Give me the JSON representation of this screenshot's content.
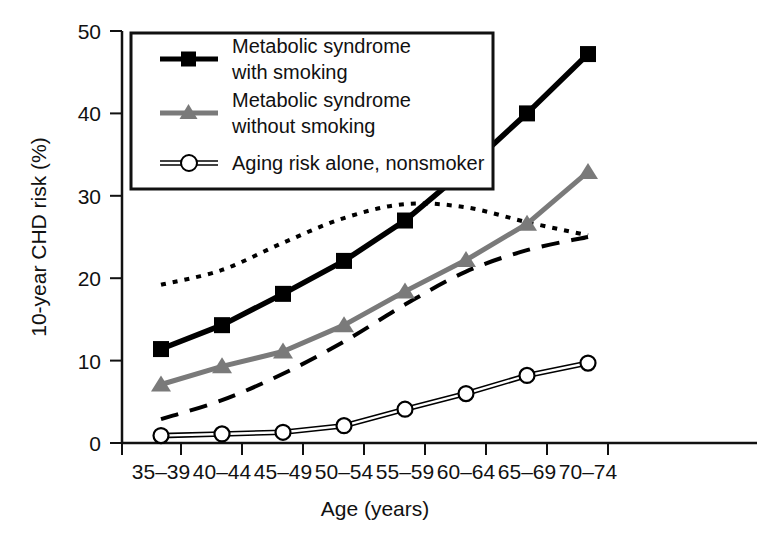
{
  "chart_data": {
    "type": "line",
    "title": "",
    "xlabel": "Age (years)",
    "ylabel": "10-year CHD risk (%)",
    "categories": [
      "35–39",
      "40–44",
      "45–49",
      "50–54",
      "55–59",
      "60–64",
      "65–69",
      "70–74"
    ],
    "xtick_labels": [
      "35–39",
      "40–44",
      "45–49",
      "50–54",
      "55–59",
      "60–64",
      "65–69",
      "70–74"
    ],
    "ytick_labels": [
      "0",
      "10",
      "20",
      "30",
      "40",
      "50"
    ],
    "ytick_values": [
      0,
      10,
      20,
      30,
      40,
      50
    ],
    "ylim": [
      0,
      50
    ],
    "grid": false,
    "legend_position": "upper-left-inside",
    "series": [
      {
        "name": "Metabolic syndrome with smoking",
        "legend_label_line1": "Metabolic syndrome",
        "legend_label_line2": "with smoking",
        "color": "#000000",
        "marker": "square",
        "style": "solid",
        "values": [
          11.4,
          14.3,
          18.1,
          22.1,
          27.0,
          33.2,
          40.0,
          47.2
        ]
      },
      {
        "name": "Metabolic syndrome without smoking",
        "legend_label_line1": "Metabolic syndrome",
        "legend_label_line2": "without smoking",
        "color": "#7a7a7a",
        "marker": "triangle",
        "style": "solid",
        "values": [
          7.1,
          9.3,
          11.1,
          14.3,
          18.4,
          22.2,
          26.6,
          32.9
        ]
      },
      {
        "name": "Aging risk alone, nonsmoker",
        "legend_label_line1": "Aging risk alone, nonsmoker",
        "legend_label_line2": "",
        "color": "#000000",
        "marker": "open-circle",
        "style": "solid-thin",
        "values": [
          0.9,
          1.1,
          1.3,
          2.1,
          4.1,
          6.0,
          8.2,
          9.7
        ]
      },
      {
        "name": "unlabeled dotted curve",
        "legend_label_line1": "",
        "legend_label_line2": "",
        "color": "#000000",
        "marker": "none",
        "style": "dotted",
        "values": [
          19.2,
          21.0,
          24.3,
          27.3,
          29.0,
          28.6,
          26.8,
          25.2
        ]
      },
      {
        "name": "unlabeled dashed curve",
        "legend_label_line1": "",
        "legend_label_line2": "",
        "color": "#000000",
        "marker": "none",
        "style": "dashed",
        "values": [
          2.9,
          5.2,
          8.4,
          12.3,
          16.8,
          20.8,
          23.4,
          25.0
        ]
      }
    ]
  },
  "legend": {
    "items": [
      {
        "label_line1": "Metabolic syndrome",
        "label_line2": "with smoking",
        "marker": "square"
      },
      {
        "label_line1": "Metabolic syndrome",
        "label_line2": "without smoking",
        "marker": "triangle"
      },
      {
        "label_line1": "Aging risk alone, nonsmoker",
        "label_line2": "",
        "marker": "open-circle"
      }
    ]
  }
}
